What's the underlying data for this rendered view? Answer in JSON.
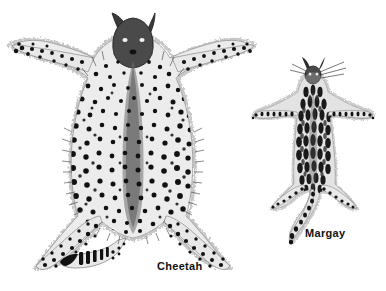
{
  "figure": {
    "background_color": "#ffffff",
    "ink_color": "#1a1a1a",
    "width": 386,
    "height": 291,
    "medium": "black-and-white line illustration / halftone engraving"
  },
  "specimens": [
    {
      "id": "cheetah",
      "label": "Cheetah",
      "label_position": {
        "x": 157,
        "y": 261
      },
      "description": "Large flat-stretched spotted cat pelt, head at top with two small ears, four limbs splayed outward, long ringed tail at lower left",
      "coat_pattern": "dense solid round black spots on pale ground",
      "relative_size": "large",
      "bounds": {
        "x": 8,
        "y": 8,
        "width": 250,
        "height": 275
      },
      "center": {
        "x": 133,
        "y": 150
      },
      "head": {
        "x": 133,
        "y": 26
      },
      "fore_paws": [
        {
          "x": 16,
          "y": 54
        },
        {
          "x": 252,
          "y": 50
        }
      ],
      "hind_paws": [
        {
          "x": 30,
          "y": 268
        },
        {
          "x": 232,
          "y": 270
        }
      ],
      "tail_tip": {
        "x": 68,
        "y": 266
      },
      "tail_pattern": "solid black bands and rings near tip"
    },
    {
      "id": "margay",
      "label": "Margay",
      "label_position": {
        "x": 305,
        "y": 228
      },
      "description": "Small flat-stretched spotted cat pelt, narrow body, head at top with whiskers, four slender limbs, long curving tail at lower left",
      "coat_pattern": "elongated blotches, streaks and rosette-like markings",
      "relative_size": "small",
      "bounds": {
        "x": 248,
        "y": 60,
        "width": 130,
        "height": 185
      },
      "center": {
        "x": 313,
        "y": 140
      },
      "head": {
        "x": 313,
        "y": 72
      },
      "fore_paws": [
        {
          "x": 255,
          "y": 114
        },
        {
          "x": 370,
          "y": 114
        }
      ],
      "hind_paws": [
        {
          "x": 272,
          "y": 208
        },
        {
          "x": 355,
          "y": 205
        }
      ],
      "tail_tip": {
        "x": 288,
        "y": 243
      },
      "tail_pattern": "segmented dark blotches along length"
    }
  ],
  "labels": {
    "cheetah": "Cheetah",
    "margay": "Margay"
  }
}
